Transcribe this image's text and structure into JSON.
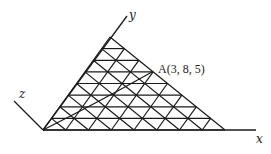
{
  "diagram": {
    "type": "3d-coordinate-triangular-grid",
    "axes": {
      "x_label": "x",
      "y_label": "y",
      "z_label": "z"
    },
    "point": {
      "name": "A",
      "coords": [
        3,
        8,
        5
      ],
      "label": "A(3, 8, 5)"
    },
    "grid": {
      "divisions": 8,
      "origin_px": [
        43,
        130
      ],
      "apex_px": [
        110,
        37
      ],
      "right_vertex_px": [
        225,
        130
      ]
    },
    "colors": {
      "line": "#1a1a1a",
      "background": "#ffffff"
    }
  }
}
